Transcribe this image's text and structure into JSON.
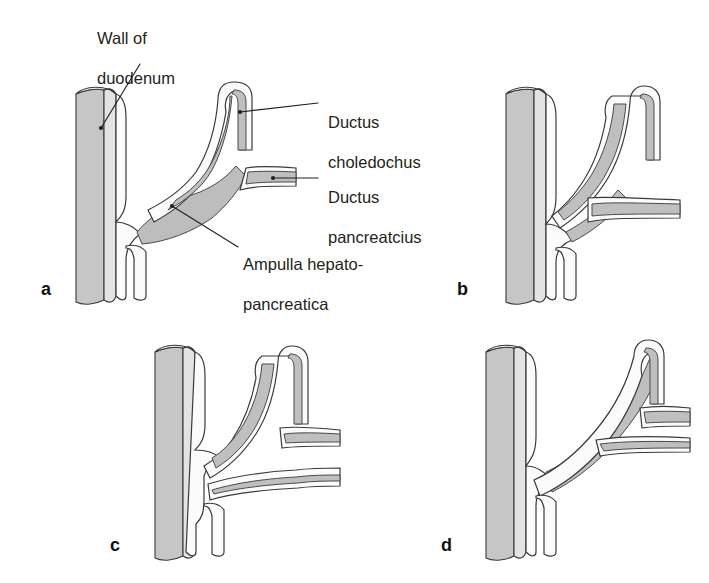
{
  "figure": {
    "background_color": "#ffffff",
    "ink_color": "#231f20",
    "wall_fill_color": "#c6c6c6",
    "duct_lumen_color": "#bfbfbf",
    "duct_sheath_color": "#fbfbfb"
  },
  "callouts": [
    {
      "id": "wall-of-duodenum",
      "text": "Wall of\nduodenum",
      "line1": "Wall of",
      "line2": "duodenum"
    },
    {
      "id": "ductus-choledochus",
      "text": "Ductus\ncholedochus",
      "line1": "Ductus",
      "line2": "choledochus"
    },
    {
      "id": "ductus-pancreatcius",
      "text": "Ductus\npancreatcius",
      "line1": "Ductus",
      "line2": "pancreatcius"
    },
    {
      "id": "ampulla-hepatopancreatica",
      "text": "Ampulla hepato-\npancreatica",
      "line1": "Ampulla hepato-",
      "line2": "pancreatica"
    }
  ],
  "panels": [
    {
      "id": "a",
      "letter": "a",
      "description": "Common channel dilated into an ampulla hepatopancreatica"
    },
    {
      "id": "b",
      "letter": "b",
      "description": "Short common channel without ampullary dilatation"
    },
    {
      "id": "c",
      "letter": "c",
      "description": "Ducts open separately on the papilla"
    },
    {
      "id": "d",
      "letter": "d",
      "description": "Pancreatic duct joins the bile duct high above the wall"
    }
  ]
}
